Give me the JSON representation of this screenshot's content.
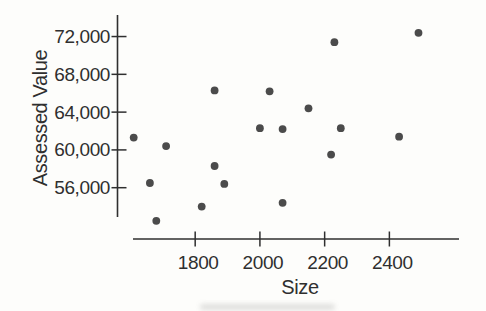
{
  "figure": {
    "background": "#fdfdfb",
    "ink_color": "#2f2f2f",
    "dot_color": "#4b4b4b"
  },
  "chart_data": {
    "type": "scatter",
    "title": "",
    "xlabel": "Size",
    "ylabel": "Assessed Value",
    "x_tick_labels": [
      "1800",
      "2000",
      "2200",
      "2400"
    ],
    "x_tick_values": [
      1800,
      2000,
      2200,
      2400
    ],
    "y_tick_labels": [
      "56,000",
      "60,000",
      "64,000",
      "68,000",
      "72,000"
    ],
    "y_tick_values": [
      56000,
      60000,
      64000,
      68000,
      72000
    ],
    "xlim": [
      1560,
      2612
    ],
    "ylim": [
      50570,
      74280
    ],
    "grid": false,
    "legend": null,
    "points": [
      {
        "size": 1610,
        "assessed_value": 61300
      },
      {
        "size": 1660,
        "assessed_value": 56500
      },
      {
        "size": 1680,
        "assessed_value": 52500
      },
      {
        "size": 1710,
        "assessed_value": 60400
      },
      {
        "size": 1820,
        "assessed_value": 54000
      },
      {
        "size": 1860,
        "assessed_value": 66300
      },
      {
        "size": 1860,
        "assessed_value": 58300
      },
      {
        "size": 1890,
        "assessed_value": 56400
      },
      {
        "size": 2000,
        "assessed_value": 62300
      },
      {
        "size": 2030,
        "assessed_value": 66200
      },
      {
        "size": 2070,
        "assessed_value": 62200
      },
      {
        "size": 2070,
        "assessed_value": 54400
      },
      {
        "size": 2150,
        "assessed_value": 64400
      },
      {
        "size": 2220,
        "assessed_value": 59500
      },
      {
        "size": 2230,
        "assessed_value": 71400
      },
      {
        "size": 2250,
        "assessed_value": 62300
      },
      {
        "size": 2430,
        "assessed_value": 61400
      },
      {
        "size": 2490,
        "assessed_value": 72400
      }
    ]
  }
}
